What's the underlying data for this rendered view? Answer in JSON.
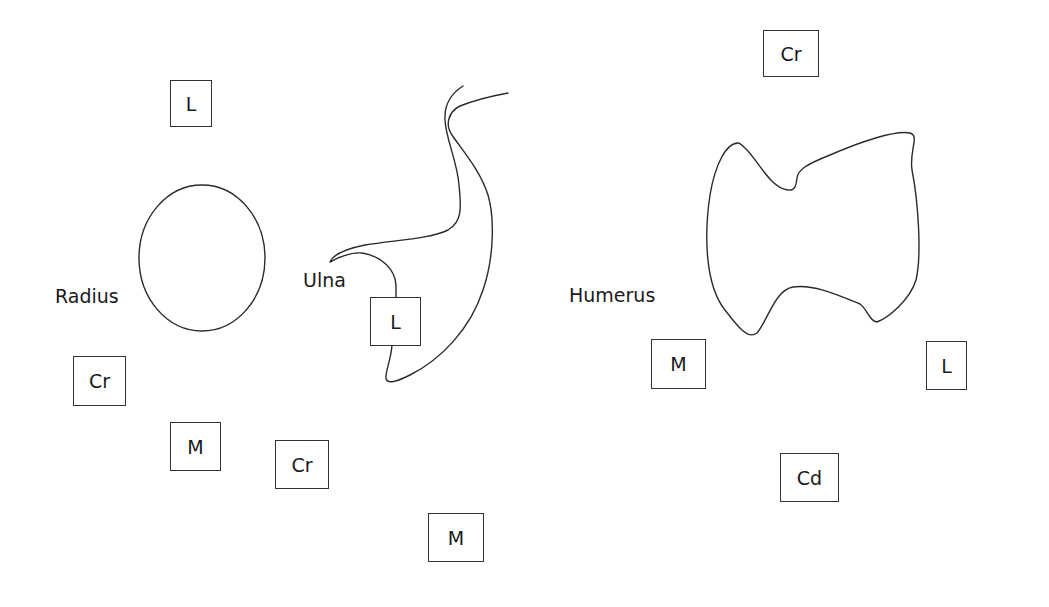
{
  "diagram": {
    "bones": [
      {
        "name": "Radius",
        "label_x": 55,
        "label_y": 287
      },
      {
        "name": "Ulna",
        "label_x": 303,
        "label_y": 271
      },
      {
        "name": "Humerus",
        "label_x": 569,
        "label_y": 286
      }
    ],
    "orientation_boxes": [
      {
        "text": "L",
        "x": 170,
        "y": 80,
        "w": 42,
        "h": 47,
        "group": "radius"
      },
      {
        "text": "Cr",
        "x": 73,
        "y": 356,
        "w": 53,
        "h": 50,
        "group": "radius"
      },
      {
        "text": "M",
        "x": 170,
        "y": 422,
        "w": 51,
        "h": 49,
        "group": "radius"
      },
      {
        "text": "L",
        "x": 370,
        "y": 297,
        "w": 51,
        "h": 49,
        "group": "ulna"
      },
      {
        "text": "Cr",
        "x": 275,
        "y": 440,
        "w": 54,
        "h": 49,
        "group": "ulna"
      },
      {
        "text": "M",
        "x": 428,
        "y": 513,
        "w": 56,
        "h": 49,
        "group": "ulna"
      },
      {
        "text": "Cr",
        "x": 763,
        "y": 30,
        "w": 56,
        "h": 47,
        "group": "humerus"
      },
      {
        "text": "M",
        "x": 651,
        "y": 339,
        "w": 55,
        "h": 50,
        "group": "humerus"
      },
      {
        "text": "L",
        "x": 926,
        "y": 341,
        "w": 41,
        "h": 49,
        "group": "humerus"
      },
      {
        "text": "Cd",
        "x": 780,
        "y": 453,
        "w": 59,
        "h": 49,
        "group": "humerus"
      }
    ],
    "legend_meaning": {
      "L": "Lateral",
      "M": "Medial",
      "Cr": "Cranial",
      "Cd": "Caudal"
    },
    "stroke_color": "#2b2b2b",
    "background": "#ffffff"
  }
}
